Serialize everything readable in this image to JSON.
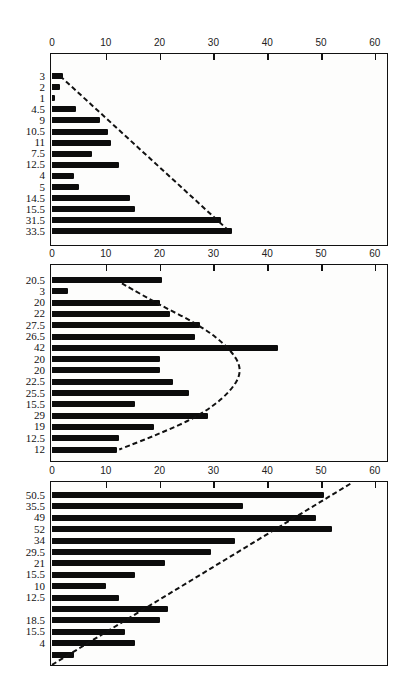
{
  "chart_data": [
    {
      "type": "bar",
      "orientation": "horizontal",
      "title": "",
      "xlabel": "",
      "ylabel": "",
      "xlim": [
        0,
        60
      ],
      "xticks": [
        0,
        10,
        20,
        30,
        40,
        50,
        60
      ],
      "grid": false,
      "legend": null,
      "categories": [
        "3",
        "2",
        "1",
        "4.5",
        "9",
        "10.5",
        "11",
        "7.5",
        "12.5",
        "4",
        "5",
        "14.5",
        "15.5",
        "31.5",
        "33.5"
      ],
      "values": [
        2,
        1.5,
        0.5,
        4.5,
        9,
        10.5,
        11,
        7.5,
        12.5,
        4,
        5,
        14.5,
        15.5,
        31.5,
        33.5
      ],
      "annotations": [
        "dashed straight line from (1.5, top bar) to (33, bottom bar)"
      ]
    },
    {
      "type": "bar",
      "orientation": "horizontal",
      "title": "",
      "xlabel": "",
      "ylabel": "",
      "xlim": [
        0,
        60
      ],
      "xticks": [
        0,
        10,
        20,
        30,
        40,
        50,
        60
      ],
      "grid": false,
      "legend": null,
      "categories": [
        "20.5",
        "3",
        "20",
        "22",
        "27.5",
        "26.5",
        "42",
        "20",
        "20",
        "22.5",
        "25.5",
        "15.5",
        "29",
        "19",
        "12.5",
        "12"
      ],
      "values": [
        20.5,
        3,
        20,
        22,
        27.5,
        26.5,
        42,
        20,
        20,
        22.5,
        25.5,
        15.5,
        29,
        19,
        12.5,
        12
      ],
      "annotations": [
        "dashed parabolic curve from (13, top) peaking near 35.5 at middle rows back to (12, bottom)"
      ]
    },
    {
      "type": "bar",
      "orientation": "horizontal",
      "title": "",
      "xlabel": "",
      "ylabel": "",
      "xlim": [
        0,
        60
      ],
      "xticks": [
        0,
        10,
        20,
        30,
        40,
        50,
        60
      ],
      "grid": false,
      "legend": null,
      "categories": [
        "50.5",
        "35.5",
        "49",
        "52",
        "34",
        "29.5",
        "21",
        "15.5",
        "10",
        "12.5",
        "",
        "18.5",
        "15.5",
        "4",
        ""
      ],
      "values": [
        50.5,
        35.5,
        49,
        52,
        34,
        29.5,
        21,
        15.5,
        10,
        12.5,
        21.5,
        20,
        13.5,
        15.5,
        4
      ],
      "annotations": [
        "dashed straight line from (0, bottom) rising to (55.5, top)"
      ]
    }
  ]
}
